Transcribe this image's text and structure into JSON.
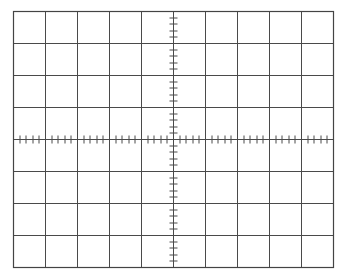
{
  "graticule": {
    "left": 13,
    "top": 11,
    "divisions_x": 10,
    "divisions_y": 8,
    "division_px": 32,
    "minor_ticks_per_division": 5,
    "tick_half_length": 4,
    "line_color": "#4a4a4a",
    "border_color": "#444444",
    "background": "#ffffff"
  }
}
